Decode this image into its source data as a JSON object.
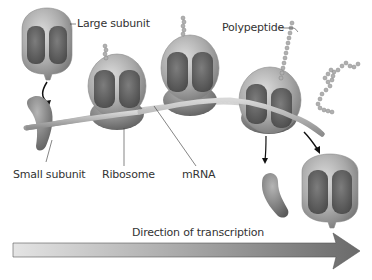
{
  "diagram": {
    "labels": {
      "large_subunit": "Large subunit",
      "polypeptide": "Polypeptide",
      "small_subunit": "Small subunit",
      "ribosome": "Ribosome",
      "mrna": "mRNA",
      "direction": "Direction of transcription"
    },
    "colors": {
      "ribosome_body": "#a9a9a9",
      "ribosome_cavity": "#5f5f5f",
      "mrna_strand": "#b9b9b9",
      "polypeptide_bead": "#b0b0b0",
      "arrow_light": "#e4e4e4",
      "arrow_dark": "#6a6a6a",
      "text": "#333333"
    },
    "ribosome_count": 4,
    "free_subunits": [
      "large_subunit_top_left",
      "small_subunit_left",
      "small_subunit_released",
      "large_subunit_released"
    ]
  }
}
